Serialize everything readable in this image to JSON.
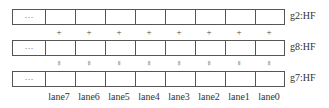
{
  "registers": [
    {
      "label": "g2:HF",
      "first_cell": "···"
    },
    {
      "label": "g8:HF",
      "first_cell": "···"
    },
    {
      "label": "g7:HF",
      "first_cell": "···"
    }
  ],
  "operators": {
    "between_1_2": "+",
    "between_2_3": "="
  },
  "lanes": [
    "lane7",
    "lane6",
    "lane5",
    "lane4",
    "lane3",
    "lane2",
    "lane1",
    "lane0"
  ]
}
